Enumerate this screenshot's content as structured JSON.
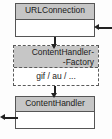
{
  "diagram": {
    "type": "uml-class-diagram",
    "background_color": "#fdfdfd",
    "header_fill_color": "#c6c6c6",
    "body_fill_color": "#ffffff",
    "line_color": "#222222",
    "border_color": "#555555",
    "classes": [
      {
        "id": "urlconnection",
        "name": "URLConnection",
        "border_style": "solid",
        "compartments": [
          ""
        ]
      },
      {
        "id": "contenthandlerfactory",
        "name_line1": "ContentHandler-",
        "name_line2": "-Factory",
        "border_style": "dashed",
        "compartments": [
          "gif / au / ..."
        ]
      },
      {
        "id": "contenthandler",
        "name": "ContentHandler",
        "border_style": "solid",
        "compartments": [
          ""
        ]
      }
    ],
    "connectors": [
      {
        "id": "url-to-factory",
        "from": "urlconnection",
        "to": "contenthandlerfactory",
        "direction": "down",
        "arrowhead": "filled"
      },
      {
        "id": "factory-to-handler",
        "from": "contenthandlerfactory",
        "to": "contenthandler",
        "direction": "down",
        "arrowhead": "filled"
      },
      {
        "id": "into-urlconnection",
        "from": "external-right",
        "to": "urlconnection",
        "direction": "left",
        "arrowhead": "filled"
      },
      {
        "id": "out-of-contenthandler",
        "from": "contenthandler",
        "to": "external-left",
        "direction": "left",
        "arrowhead": "filled"
      }
    ]
  }
}
